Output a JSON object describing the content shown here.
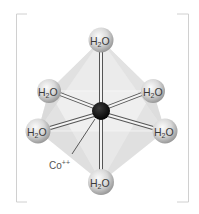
{
  "figure": {
    "central_ion": {
      "label": "Co",
      "charge": "++",
      "color": "#111111"
    },
    "ligands": [
      {
        "id": "top",
        "label": "H",
        "subscript": "2",
        "suffix": "O"
      },
      {
        "id": "upper-left",
        "label": "H",
        "subscript": "2",
        "suffix": "O"
      },
      {
        "id": "upper-right",
        "label": "H",
        "subscript": "2",
        "suffix": "O"
      },
      {
        "id": "lower-left",
        "label": "H",
        "subscript": "2",
        "suffix": "O"
      },
      {
        "id": "lower-right",
        "label": "H",
        "subscript": "2",
        "suffix": "O"
      },
      {
        "id": "bottom",
        "label": "H",
        "subscript": "2",
        "suffix": "O"
      }
    ],
    "colors": {
      "sphere_light": "#f4f4f4",
      "sphere_dark": "#9a9a9a",
      "face_light": "#ececec",
      "face_mid": "#dcdcdc",
      "face_dark": "#c8c8c8",
      "bond": "#555555",
      "bracket": "#cfcfcf"
    }
  }
}
